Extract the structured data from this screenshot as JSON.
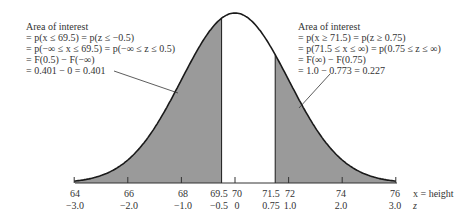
{
  "colors": {
    "shade": "#9a9a9a",
    "curve": "#1a1a1a",
    "axis": "#333333",
    "text": "#333333",
    "background": "#ffffff"
  },
  "diagram": {
    "type": "normal-distribution",
    "mean_x": 70,
    "sd_x": 2,
    "shaded_left_upper_x": 69.5,
    "shaded_right_lower_x": 71.5
  },
  "left_annotation": {
    "lines": [
      "Area of interest",
      "= p(x ≤ 69.5) = p(z ≤ −0.5)",
      "= p(−∞ ≤ x ≤ 69.5) = p(−∞ ≤ z ≤ 0.5)",
      "= F(0.5) − F(−∞)",
      "= 0.401 − 0 = 0.401"
    ]
  },
  "right_annotation": {
    "lines": [
      "Area of interest",
      "= p(x ≥ 71.5) = p(z ≥ 0.75)",
      "= p(71.5 ≤ x ≤ ∞) = p(0.75 ≤ z ≤ ∞)",
      "= F(∞) − F(0.75)",
      "= 1.0 − 0.773 = 0.227"
    ]
  },
  "axis": {
    "x_ticks": [
      "64",
      "66",
      "68",
      "69.5",
      "70",
      "71.5",
      "72",
      "74",
      "76"
    ],
    "z_ticks": [
      "−3.0",
      "−2.0",
      "−1.0",
      "−0.5",
      "0",
      "0.75",
      "1.0",
      "2.0",
      "3.0"
    ],
    "x_label": "x = height",
    "z_label": "z"
  }
}
